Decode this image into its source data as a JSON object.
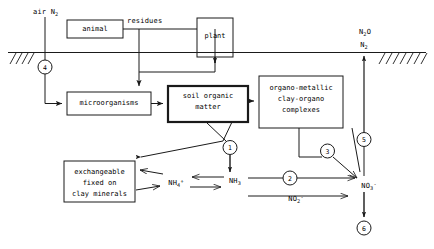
{
  "diagram": {
    "colors": {
      "line": "#1a1a1a",
      "text": "#000000",
      "background": "#ffffff"
    },
    "boxes": [
      {
        "id": "animal",
        "label": "animal",
        "lines": [
          "animal"
        ]
      },
      {
        "id": "plant",
        "label": "plant",
        "lines": [
          "plant"
        ]
      },
      {
        "id": "microorganisms",
        "label": "microorganisms",
        "lines": [
          "microorganisms"
        ]
      },
      {
        "id": "soil-organic-matter",
        "label": "soil organic matter",
        "lines": [
          "soil organic",
          "matter"
        ]
      },
      {
        "id": "organo-metallic",
        "label": "organo-metallic clay-organo complexes",
        "lines": [
          "organo-metallic",
          "clay-organo",
          "complexes"
        ]
      },
      {
        "id": "exchangeable",
        "label": "exchangeable fixed on clay minerals",
        "lines": [
          "exchangeable",
          "fixed on",
          "clay minerals"
        ]
      }
    ],
    "labels": {
      "air_n2": "air N2",
      "residues": "residues",
      "n2o": "N2O",
      "n2": "N2",
      "nh4": "NH4+",
      "nh3": "NH3",
      "no2": "NO2-",
      "no3": "NO3-"
    },
    "numbered_nodes": [
      {
        "id": "node-1",
        "label": "1"
      },
      {
        "id": "node-2",
        "label": "2"
      },
      {
        "id": "node-3",
        "label": "3"
      },
      {
        "id": "node-4",
        "label": "4"
      },
      {
        "id": "node-5",
        "label": "5"
      },
      {
        "id": "node-6",
        "label": "6"
      }
    ]
  }
}
